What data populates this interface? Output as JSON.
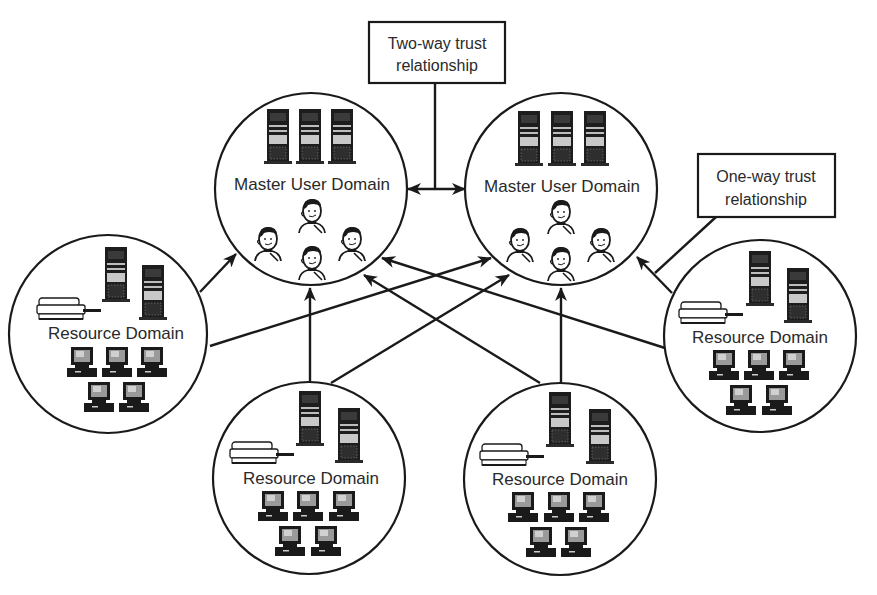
{
  "diagram": {
    "type": "trust-relationship-network",
    "callouts": {
      "two_way": {
        "line1": "Two-way trust",
        "line2": "relationship"
      },
      "one_way": {
        "line1": "One-way trust",
        "line2": "relationship"
      }
    },
    "master_domains": [
      {
        "id": "master-left",
        "label": "Master User Domain",
        "cx": 311,
        "cy": 189,
        "r": 96,
        "servers": 3,
        "users": 4
      },
      {
        "id": "master-right",
        "label": "Master User Domain",
        "cx": 561,
        "cy": 189,
        "r": 96,
        "servers": 3,
        "users": 4
      }
    ],
    "resource_domains": [
      {
        "id": "resource-left",
        "label": "Resource Domain",
        "cx": 108,
        "cy": 334,
        "r": 99,
        "servers": 2,
        "printers": 1,
        "workstations": 5
      },
      {
        "id": "resource-bottom-left",
        "label": "Resource Domain",
        "cx": 309,
        "cy": 478,
        "r": 96,
        "servers": 2,
        "printers": 1,
        "workstations": 5
      },
      {
        "id": "resource-bottom-right",
        "label": "Resource Domain",
        "cx": 560,
        "cy": 479,
        "r": 96,
        "servers": 2,
        "printers": 1,
        "workstations": 5
      },
      {
        "id": "resource-right",
        "label": "Resource Domain",
        "cx": 760,
        "cy": 336,
        "r": 96,
        "servers": 2,
        "printers": 1,
        "workstations": 5
      }
    ],
    "relationships": [
      {
        "from": "master-left",
        "to": "master-right",
        "kind": "two-way"
      },
      {
        "from": "resource-left",
        "to": "master-left",
        "kind": "one-way"
      },
      {
        "from": "resource-left",
        "to": "master-right",
        "kind": "one-way"
      },
      {
        "from": "resource-bottom-left",
        "to": "master-left",
        "kind": "one-way"
      },
      {
        "from": "resource-bottom-left",
        "to": "master-right",
        "kind": "one-way"
      },
      {
        "from": "resource-bottom-right",
        "to": "master-left",
        "kind": "one-way"
      },
      {
        "from": "resource-bottom-right",
        "to": "master-right",
        "kind": "one-way"
      },
      {
        "from": "resource-right",
        "to": "master-left",
        "kind": "one-way"
      },
      {
        "from": "resource-right",
        "to": "master-right",
        "kind": "one-way"
      }
    ]
  }
}
